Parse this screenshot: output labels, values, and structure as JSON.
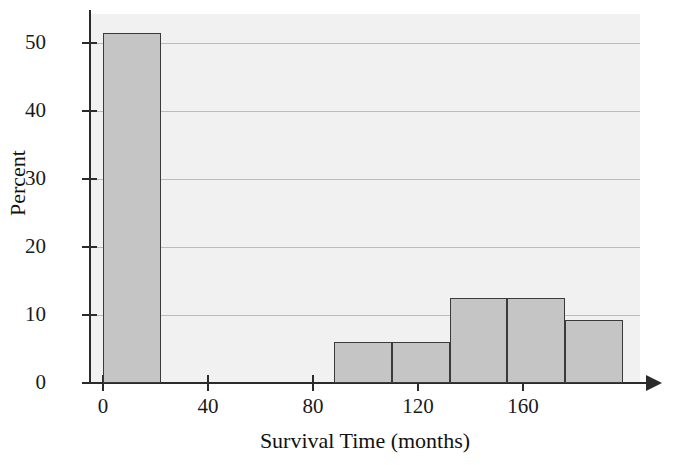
{
  "chart_data": {
    "type": "bar",
    "title": "",
    "xlabel": "Survival Time (months)",
    "ylabel": "Percent",
    "grid": true,
    "legend": null,
    "xlim": [
      0,
      210
    ],
    "ylim": [
      0,
      54
    ],
    "xticks": [
      0,
      40,
      80,
      120,
      160
    ],
    "yticks": [
      0,
      10,
      20,
      30,
      40,
      50
    ],
    "xtick_labels": [
      "0",
      "40",
      "80",
      "120",
      "160"
    ],
    "ytick_labels": [
      "0",
      "10",
      "20",
      "30",
      "40",
      "50"
    ],
    "bin_width": 22,
    "bins": [
      {
        "label": "0-22",
        "x0": 0,
        "x1": 22,
        "value": 51.5
      },
      {
        "label": "88-110",
        "x0": 88,
        "x1": 110,
        "value": 6.1
      },
      {
        "label": "110-132",
        "x0": 110,
        "x1": 132,
        "value": 6.1
      },
      {
        "label": "132-154",
        "x0": 132,
        "x1": 154,
        "value": 12.5
      },
      {
        "label": "154-176",
        "x0": 154,
        "x1": 176,
        "value": 12.5
      },
      {
        "label": "176-198",
        "x0": 176,
        "x1": 198,
        "value": 9.3
      }
    ],
    "categories": [
      "0-22",
      "88-110",
      "110-132",
      "132-154",
      "154-176",
      "176-198"
    ],
    "values": [
      51.5,
      6.1,
      6.1,
      12.5,
      12.5,
      9.3
    ],
    "colors": {
      "bar_fill": "#c5c5c5",
      "bar_border": "#3a3a3a",
      "panel_background": "#f1f1f1",
      "gridline": "#bcbcbc",
      "axis": "#2b2b2b",
      "text": "#111111"
    }
  }
}
